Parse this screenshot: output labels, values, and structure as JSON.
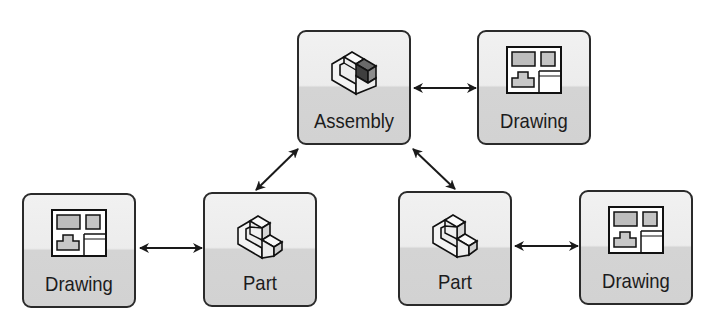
{
  "diagram": {
    "nodes": [
      {
        "id": "assembly",
        "label": "Assembly",
        "icon": "assembly-icon",
        "x": 297,
        "y": 30
      },
      {
        "id": "drawing-top",
        "label": "Drawing",
        "icon": "drawing-icon",
        "x": 477,
        "y": 30
      },
      {
        "id": "drawing-left",
        "label": "Drawing",
        "icon": "drawing-icon",
        "x": 22,
        "y": 193
      },
      {
        "id": "part-left",
        "label": "Part",
        "icon": "part-icon",
        "x": 203,
        "y": 192
      },
      {
        "id": "part-right",
        "label": "Part",
        "icon": "part-icon",
        "x": 398,
        "y": 191
      },
      {
        "id": "drawing-right",
        "label": "Drawing",
        "icon": "drawing-icon",
        "x": 579,
        "y": 190
      }
    ],
    "edges": [
      {
        "from": "assembly",
        "to": "drawing-top",
        "type": "bidirectional"
      },
      {
        "from": "assembly",
        "to": "part-left",
        "type": "bidirectional"
      },
      {
        "from": "assembly",
        "to": "part-right",
        "type": "bidirectional"
      },
      {
        "from": "drawing-left",
        "to": "part-left",
        "type": "bidirectional"
      },
      {
        "from": "part-right",
        "to": "drawing-right",
        "type": "bidirectional"
      }
    ],
    "colors": {
      "border": "#2a2a2a",
      "top_fill": "#efefef",
      "bottom_fill": "#d3d3d3",
      "arrow": "#1a1a1a"
    }
  }
}
